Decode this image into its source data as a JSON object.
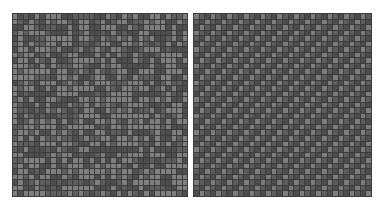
{
  "panels": [
    {
      "id": "left",
      "pattern": "random-noise",
      "cols": 32,
      "rows": 33,
      "seed": 7,
      "light_ratio": 0.42,
      "colors": {
        "grid": "#3c3c3c",
        "dark": "#4e4e4e",
        "mid": "#5e5e5e",
        "light": "#7f7f7f"
      }
    },
    {
      "id": "right",
      "pattern": "diagonal-stripes",
      "direction": "up-right",
      "period": 3,
      "cols": 32,
      "rows": 33,
      "colors": {
        "grid": "#3c3c3c",
        "dark": "#4c4c4c",
        "mid": "#5c5c5c",
        "light": "#7d7d7d"
      }
    }
  ]
}
